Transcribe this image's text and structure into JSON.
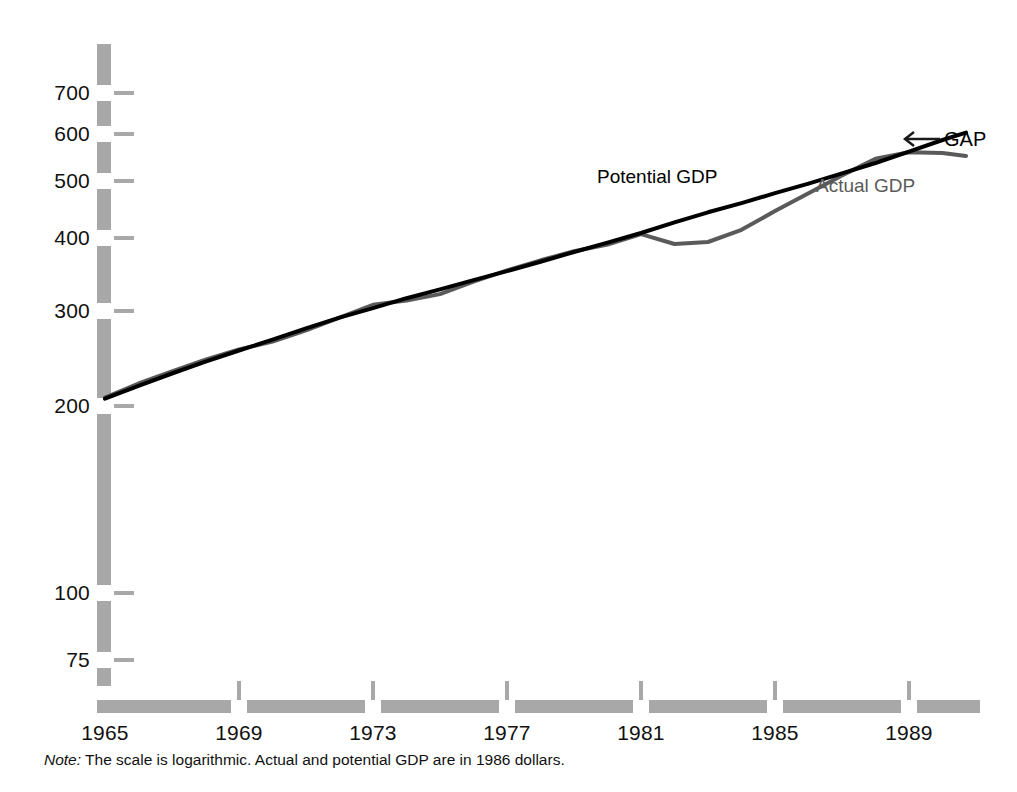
{
  "figure": {
    "note_label": "Note:",
    "note_text": " The scale is logarithmic. Actual and potential GDP are in 1986 dollars.",
    "axis_color": "#a8a8a8",
    "potential_color": "#000000",
    "actual_color": "#5a5a5a"
  },
  "labels": {
    "potential": "Potential GDP",
    "actual": "Actual GDP",
    "gap": "GAP",
    "gap_arrow": "←"
  },
  "chart_data": {
    "type": "line",
    "title": "",
    "subtitle": "",
    "xlabel": "",
    "ylabel": "",
    "yscale": "log",
    "xscale": "linear",
    "grid": false,
    "legend": "inline-annotations",
    "xlim": [
      1965,
      1990.7
    ],
    "ylim": [
      68,
      790
    ],
    "xticks": [
      1965,
      1969,
      1973,
      1977,
      1981,
      1985,
      1989
    ],
    "xticklabels": [
      "1965",
      "1969",
      "1973",
      "1977",
      "1981",
      "1985",
      "1989"
    ],
    "yticks": [
      75,
      100,
      200,
      300,
      400,
      500,
      600,
      700
    ],
    "yticklabels": [
      "75",
      "100",
      "200",
      "300",
      "400",
      "500",
      "600",
      "700"
    ],
    "units": "billions of 1986 dollars",
    "x": [
      1965,
      1966,
      1967,
      1968,
      1969,
      1970,
      1971,
      1972,
      1973,
      1974,
      1975,
      1976,
      1977,
      1978,
      1979,
      1980,
      1981,
      1982,
      1983,
      1984,
      1985,
      1986,
      1987,
      1988,
      1989,
      1990,
      1990.7
    ],
    "series": [
      {
        "name": "Potential GDP",
        "color": "#000000",
        "width": 4,
        "values": [
          213,
          224,
          235,
          246,
          257,
          268,
          280,
          292,
          303,
          315,
          326,
          338,
          350,
          363,
          377,
          391,
          406,
          423,
          440,
          456,
          474,
          492,
          512,
          533,
          557,
          583,
          600
        ]
      },
      {
        "name": "Actual GDP",
        "color": "#5a5a5a",
        "width": 4,
        "values": [
          214,
          226,
          237,
          248,
          258,
          266,
          278,
          292,
          307,
          312,
          320,
          336,
          351,
          365,
          378,
          388,
          404,
          389,
          392,
          411,
          442,
          474,
          508,
          542,
          556,
          554,
          548
        ]
      }
    ],
    "annotations": [
      {
        "text": "Potential GDP",
        "x": 1979.6,
        "y": 475,
        "color": "#000000"
      },
      {
        "text": "Actual GDP",
        "x": 1985.1,
        "y": 472,
        "color": "#5a5a5a"
      },
      {
        "text": "GAP",
        "x": 1990.0,
        "y": 600,
        "color": "#000000",
        "arrow": "left"
      }
    ]
  },
  "yticks_px": [
    {
      "label": "700",
      "y": 93
    },
    {
      "label": "600",
      "y": 134
    },
    {
      "label": "500",
      "y": 181
    },
    {
      "label": "400",
      "y": 238
    },
    {
      "label": "300",
      "y": 311
    },
    {
      "label": "200",
      "y": 406
    },
    {
      "label": "100",
      "y": 593
    },
    {
      "label": "75",
      "y": 660
    }
  ],
  "xticks_px": [
    {
      "label": "1965",
      "x": 105
    },
    {
      "label": "1969",
      "x": 239
    },
    {
      "label": "1973",
      "x": 373
    },
    {
      "label": "1977",
      "x": 507
    },
    {
      "label": "1981",
      "x": 641
    },
    {
      "label": "1985",
      "x": 775
    },
    {
      "label": "1989",
      "x": 909
    }
  ]
}
